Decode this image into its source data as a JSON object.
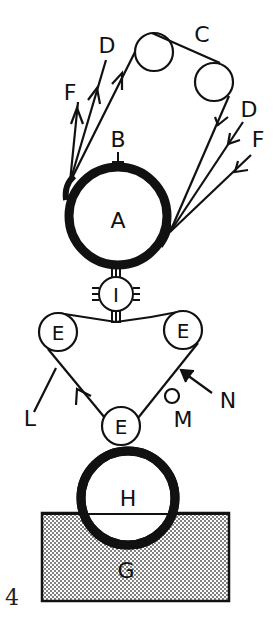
{
  "diagram": {
    "type": "schematic",
    "figure_number": "4",
    "colors": {
      "ink": "#111111",
      "background": "#ffffff",
      "hatch": "#555555"
    },
    "components": {
      "A": {
        "label": "A",
        "shape": "large-thick-circle"
      },
      "B": {
        "label": "B",
        "shape": "pointer-arrow"
      },
      "C": {
        "label": "C",
        "shape": "roller-pair"
      },
      "D_left": {
        "label": "D",
        "shape": "arrow-line"
      },
      "F_left": {
        "label": "F",
        "shape": "arrow-line"
      },
      "D_right": {
        "label": "D",
        "shape": "arrow-line"
      },
      "F_right": {
        "label": "F",
        "shape": "arrow-line"
      },
      "I": {
        "label": "I",
        "shape": "small-circle-with-connectors"
      },
      "E_left": {
        "label": "E",
        "shape": "roller"
      },
      "E_right": {
        "label": "E",
        "shape": "roller"
      },
      "E_bottom": {
        "label": "E",
        "shape": "roller"
      },
      "L": {
        "label": "L",
        "shape": "line"
      },
      "M": {
        "label": "M",
        "shape": "small-circle"
      },
      "N": {
        "label": "N",
        "shape": "pointer-arrow"
      },
      "H": {
        "label": "H",
        "shape": "large-thick-circle"
      },
      "G": {
        "label": "G",
        "shape": "stippled-rectangle"
      }
    }
  }
}
